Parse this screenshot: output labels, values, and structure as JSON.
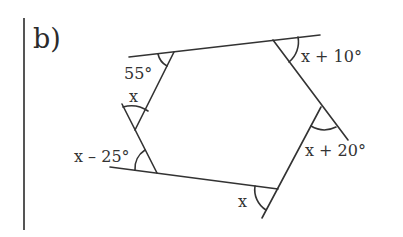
{
  "part_label": "b)",
  "diagram": {
    "type": "hexagon-exterior-angles",
    "angles": {
      "top_left_exterior": "55°",
      "left_vertex": "x",
      "bottom_left": "x – 25°",
      "bottom_right": "x",
      "right_vertex": "x + 20°",
      "top_right": "x + 10°"
    },
    "line_color": "#333333"
  }
}
